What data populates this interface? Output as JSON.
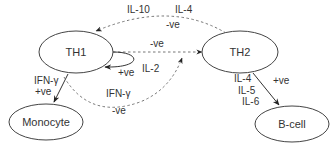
{
  "nodes": {
    "th1": {
      "label": "TH1"
    },
    "th2": {
      "label": "TH2"
    },
    "monocyte": {
      "label": "Monocyte"
    },
    "bcell": {
      "label": "B-cell"
    }
  },
  "edges": {
    "th2_to_th1_top": {
      "cytokine_a": "IL-10",
      "cytokine_b": "IL-4",
      "effect": "-ve"
    },
    "th1_to_th2_straight": {
      "effect": "-ve"
    },
    "th1_self": {
      "cytokine": "IL-2",
      "effect": "+ve"
    },
    "th1_to_monocyte": {
      "cytokine": "IFN-γ",
      "effect": "+ve"
    },
    "th1_to_th2_lower": {
      "cytokine": "IFN-γ",
      "effect": "-ve"
    },
    "th2_to_bcell": {
      "cytokine_1": "IL-4",
      "cytokine_2": "IL-5",
      "cytokine_3": "IL-6",
      "effect": "+ve"
    }
  }
}
